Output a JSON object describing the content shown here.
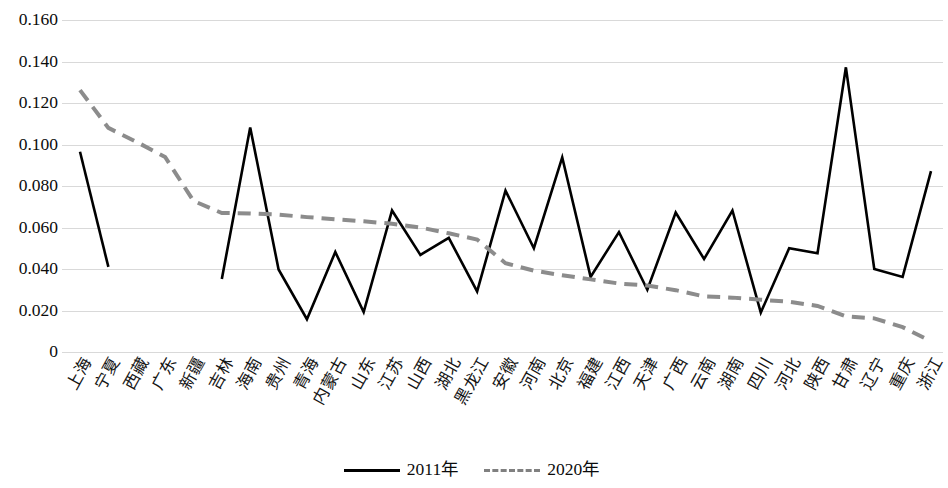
{
  "chart_data": {
    "type": "line",
    "title": "",
    "subtitle": "",
    "xlabel": "",
    "ylabel": "",
    "ylim": [
      0,
      0.16
    ],
    "grid": true,
    "legend_position": "bottom-center",
    "y_ticks": [
      "0",
      "0.020",
      "0.040",
      "0.060",
      "0.080",
      "0.100",
      "0.120",
      "0.140",
      "0.160"
    ],
    "y_tick_values": [
      0,
      0.02,
      0.04,
      0.06,
      0.08,
      0.1,
      0.12,
      0.14,
      0.16
    ],
    "categories": [
      "上海",
      "宁夏",
      "西藏",
      "广东",
      "新疆",
      "吉林",
      "海南",
      "贵州",
      "青海",
      "内蒙古",
      "山东",
      "江苏",
      "山西",
      "湖北",
      "黑龙江",
      "安徽",
      "河南",
      "北京",
      "福建",
      "江西",
      "天津",
      "广西",
      "云南",
      "湖南",
      "四川",
      "河北",
      "陕西",
      "甘肃",
      "辽宁",
      "重庆",
      "浙江"
    ],
    "series": [
      {
        "name": "2011年",
        "color": "#000000",
        "style": "solid",
        "values": [
          0.0965,
          0.041,
          null,
          null,
          null,
          0.0352,
          0.1082,
          0.0398,
          0.0158,
          0.0482,
          0.0192,
          0.0682,
          0.0468,
          0.055,
          0.0292,
          0.0778,
          0.05,
          0.0938,
          0.0362,
          0.0578,
          0.03,
          0.0672,
          0.0448,
          0.0682,
          0.019,
          0.05,
          0.0476,
          0.1372,
          0.04,
          0.0362,
          0.0872
        ]
      },
      {
        "name": "2020年",
        "color": "#8c8c8c",
        "style": "dashed",
        "values": [
          0.1262,
          0.108,
          0.1012,
          0.094,
          0.0728,
          0.067,
          0.0668,
          0.0662,
          0.065,
          0.064,
          0.063,
          0.0618,
          0.06,
          0.0572,
          0.0542,
          0.0428,
          0.0392,
          0.037,
          0.035,
          0.033,
          0.032,
          0.0298,
          0.0268,
          0.0262,
          0.0252,
          0.0242,
          0.0222,
          0.0172,
          0.0162,
          0.012,
          0.0052
        ]
      }
    ]
  },
  "legend": {
    "items": [
      {
        "label": "2011年",
        "style": "solid",
        "color": "#000000"
      },
      {
        "label": "2020年",
        "style": "dashed",
        "color": "#8c8c8c"
      }
    ]
  },
  "colors": {
    "series_2011": "#000000",
    "series_2020": "#8c8c8c",
    "gridline": "#d9d9d9",
    "background": "#ffffff"
  }
}
